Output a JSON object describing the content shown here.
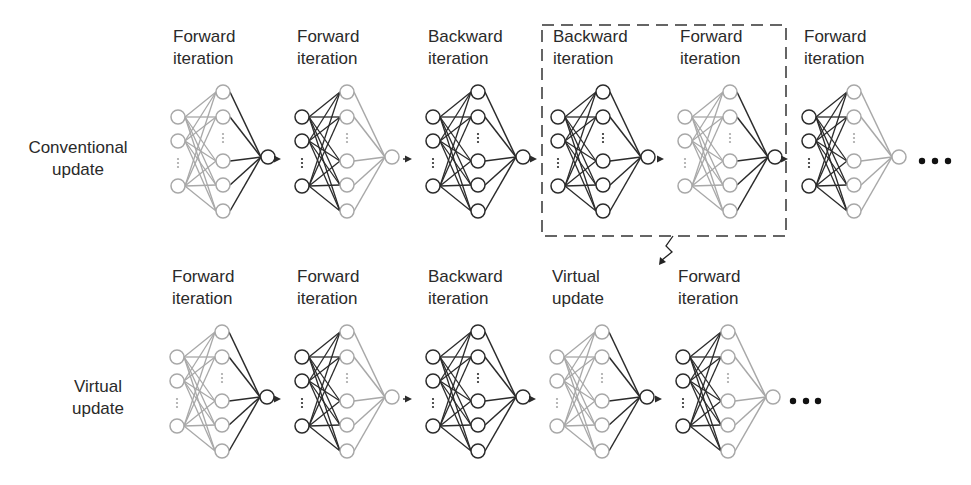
{
  "colors": {
    "dark": "#2b2b2b",
    "mid": "#555555",
    "light": "#a8a8a8",
    "background": "#ffffff"
  },
  "rows": [
    {
      "id": "conventional",
      "label_lines": [
        "Conventional",
        "update"
      ],
      "label_x": 78,
      "label_y": 157,
      "label_top": 18,
      "ellipsis": [
        922,
        935,
        948
      ],
      "ellipsis_y": 161,
      "stages": [
        {
          "title": [
            "Forward",
            "iteration"
          ],
          "x": 178,
          "input": "light",
          "output": "dark"
        },
        {
          "title": [
            "Forward",
            "iteration"
          ],
          "x": 302,
          "input": "dark",
          "output": "light"
        },
        {
          "title": [
            "Backward",
            "iteration"
          ],
          "x": 433,
          "input": "dark",
          "output": "dark"
        },
        {
          "title": [
            "Backward",
            "iteration"
          ],
          "x": 558,
          "input": "dark",
          "output": "dark"
        },
        {
          "title": [
            "Forward",
            "iteration"
          ],
          "x": 685,
          "input": "light",
          "output": "dark"
        },
        {
          "title": [
            "Forward",
            "iteration"
          ],
          "x": 809,
          "input": "dark",
          "output": "light"
        }
      ]
    },
    {
      "id": "virtual",
      "label_lines": [
        "Virtual",
        "update"
      ],
      "label_x": 98,
      "label_y": 396,
      "label_top": 258,
      "ellipsis": [
        793,
        806,
        818
      ],
      "ellipsis_y": 401,
      "stages": [
        {
          "title": [
            "Forward",
            "iteration"
          ],
          "x": 177,
          "input": "light",
          "output": "dark"
        },
        {
          "title": [
            "Forward",
            "iteration"
          ],
          "x": 302,
          "input": "dark",
          "output": "light"
        },
        {
          "title": [
            "Backward",
            "iteration"
          ],
          "x": 433,
          "input": "dark",
          "output": "dark"
        },
        {
          "title": [
            "Virtual",
            "update"
          ],
          "x": 557,
          "input": "light",
          "output": "dark"
        },
        {
          "title": [
            "Forward",
            "iteration"
          ],
          "x": 683,
          "input": "dark",
          "output": "light"
        }
      ]
    }
  ],
  "highlight_box": {
    "x": 542,
    "y": 25,
    "width": 244,
    "height": 211
  },
  "callout_arrow": {
    "from": [
      673,
      236
    ],
    "to": [
      659,
      265
    ]
  },
  "network_geometry": {
    "layer_gap": 45,
    "node_radius": 7,
    "input_offsets": [
      -40,
      -16,
      29
    ],
    "input_dots_offset": 6,
    "hidden_offsets": [
      -65,
      -40,
      4,
      28,
      54
    ],
    "hidden_dots_offset": -19,
    "output_offset": 0
  }
}
